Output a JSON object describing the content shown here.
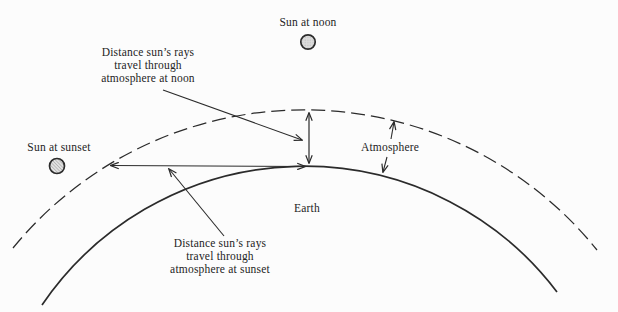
{
  "colors": {
    "background": "#fcfcfc",
    "ink": "#2b2b2b",
    "sun_fill": "#dcdcdc",
    "hatch_line": "#8f8f8f"
  },
  "labels": {
    "sun_noon": "Sun at noon",
    "sun_sunset": "Sun at sunset",
    "atmosphere": "Atmosphere",
    "earth": "Earth",
    "noon_distance": [
      "Distance sun’s rays",
      "travel through",
      "atmosphere at noon"
    ],
    "sunset_distance": [
      "Distance sun’s rays",
      "travel through",
      "atmosphere at sunset"
    ]
  },
  "icons": {
    "sun_noon": "sun-noon-icon",
    "sun_sunset": "sun-sunset-icon"
  }
}
